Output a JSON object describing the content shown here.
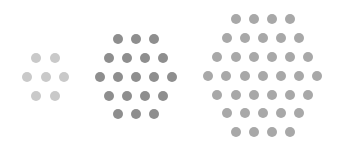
{
  "canvas": {
    "width": 343,
    "height": 148,
    "background": "#ffffff"
  },
  "clusters": [
    {
      "name": "small-hexagon-cluster",
      "color": "#c9c9c9",
      "row_counts": [
        2,
        3,
        2
      ],
      "spacing_x": 18.5,
      "rows": [
        {
          "y": 58,
          "x": [
            36,
            55
          ]
        },
        {
          "y": 77,
          "x": [
            27,
            46,
            64
          ]
        },
        {
          "y": 96,
          "x": [
            36,
            55
          ]
        }
      ]
    },
    {
      "name": "medium-hexagon-cluster",
      "color": "#8e8e8e",
      "row_counts": [
        3,
        4,
        5,
        4,
        3
      ],
      "spacing_x": 18,
      "rows": [
        {
          "y": 39,
          "x": [
            118,
            136,
            154
          ]
        },
        {
          "y": 58,
          "x": [
            109,
            127,
            145,
            163
          ]
        },
        {
          "y": 77,
          "x": [
            100,
            118,
            136,
            154,
            172
          ]
        },
        {
          "y": 96,
          "x": [
            109,
            127,
            145,
            163
          ]
        },
        {
          "y": 114,
          "x": [
            118,
            136,
            154
          ]
        }
      ]
    },
    {
      "name": "large-hexagon-cluster",
      "color": "#a8a8a8",
      "row_counts": [
        4,
        5,
        6,
        7,
        6,
        5,
        4
      ],
      "spacing_x": 18.2,
      "rows": [
        {
          "y": 19,
          "x": [
            236,
            254,
            272,
            290
          ]
        },
        {
          "y": 38,
          "x": [
            227,
            245,
            263,
            281,
            299
          ]
        },
        {
          "y": 57,
          "x": [
            217,
            236,
            254,
            272,
            290,
            308
          ]
        },
        {
          "y": 76,
          "x": [
            208,
            226,
            245,
            263,
            281,
            299,
            317
          ]
        },
        {
          "y": 95,
          "x": [
            217,
            236,
            254,
            272,
            290,
            308
          ]
        },
        {
          "y": 113,
          "x": [
            227,
            245,
            263,
            281,
            299
          ]
        },
        {
          "y": 132,
          "x": [
            236,
            254,
            272,
            290
          ]
        }
      ]
    }
  ]
}
